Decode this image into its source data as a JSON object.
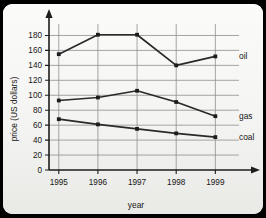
{
  "chart_data": {
    "type": "line",
    "title": "",
    "xlabel": "year",
    "ylabel": "price (US dollars)",
    "categories": [
      "1995",
      "1996",
      "1997",
      "1998",
      "1999"
    ],
    "x": [
      1995,
      1996,
      1997,
      1998,
      1999
    ],
    "xlim": [
      1994.75,
      1999.4
    ],
    "ylim": [
      0,
      190
    ],
    "yticks": [
      0,
      20,
      40,
      60,
      80,
      100,
      120,
      140,
      160,
      180
    ],
    "ytick_labels": [
      "0",
      "20",
      "40",
      "60",
      "80",
      "100",
      "120",
      "140",
      "160",
      "180"
    ],
    "grid": "both",
    "legend_position": "right-inline",
    "series": [
      {
        "name": "oil",
        "label": "oil",
        "values": [
          155,
          181,
          181,
          140,
          152
        ]
      },
      {
        "name": "gas",
        "label": "gas",
        "values": [
          93,
          97,
          106,
          91,
          72
        ]
      },
      {
        "name": "coal",
        "label": "coal",
        "values": [
          68,
          61,
          55,
          49,
          44
        ]
      }
    ],
    "colors": {
      "line": "#2a2a2a",
      "marker": "#1c1c1c",
      "grid": "#8f8f8f",
      "axis": "#1c1c1c",
      "text": "#161616",
      "paper": "#f4f4f2",
      "backdrop": "#000000"
    }
  }
}
